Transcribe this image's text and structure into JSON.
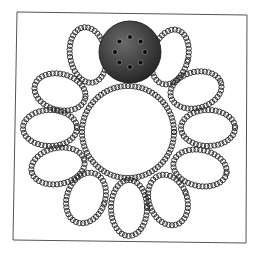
{
  "diagram": {
    "type": "coiled-loop-ring",
    "frame": {
      "corners": [
        [
          17,
          12
        ],
        [
          247,
          15
        ],
        [
          246,
          243
        ],
        [
          13,
          240
        ]
      ],
      "stroke": "#555555"
    },
    "center": {
      "x": 128,
      "y": 132,
      "inner_radius": 46
    },
    "coil": {
      "stroke": "#222222",
      "ring_radius": 2.6,
      "spacing": 3.6
    },
    "petals": [
      {
        "cx": 88,
        "cy": 55,
        "rx": 18,
        "ry": 28,
        "rot": -10
      },
      {
        "cx": 170,
        "cy": 57,
        "rx": 18,
        "ry": 28,
        "rot": 15
      },
      {
        "cx": 60,
        "cy": 92,
        "rx": 26,
        "ry": 18,
        "rot": 15
      },
      {
        "cx": 196,
        "cy": 90,
        "rx": 26,
        "ry": 18,
        "rot": -15
      },
      {
        "cx": 50,
        "cy": 128,
        "rx": 27,
        "ry": 18,
        "rot": 0
      },
      {
        "cx": 208,
        "cy": 128,
        "rx": 27,
        "ry": 18,
        "rot": 0
      },
      {
        "cx": 58,
        "cy": 166,
        "rx": 27,
        "ry": 18,
        "rot": -12
      },
      {
        "cx": 200,
        "cy": 168,
        "rx": 27,
        "ry": 18,
        "rot": 12
      },
      {
        "cx": 86,
        "cy": 198,
        "rx": 19,
        "ry": 26,
        "rot": 20
      },
      {
        "cx": 129,
        "cy": 208,
        "rx": 18,
        "ry": 28,
        "rot": 0
      },
      {
        "cx": 168,
        "cy": 200,
        "rx": 19,
        "ry": 26,
        "rot": -20
      }
    ],
    "disc": {
      "cx": 130,
      "cy": 52,
      "r": 31,
      "fill_light": "#6a6a6a",
      "fill_dark": "#1e1e1e",
      "dots": 8,
      "dot_ring_radius": 15,
      "dot_radius": 2,
      "dot_color": "#0a0a0a"
    }
  }
}
